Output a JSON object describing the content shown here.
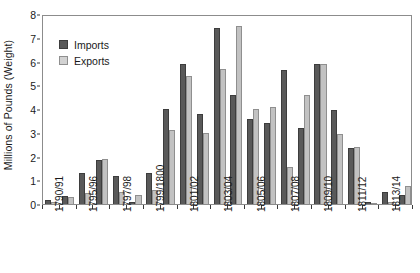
{
  "chart_data": {
    "type": "bar",
    "title": "",
    "subtitle": "",
    "xlabel": "",
    "ylabel": "Millions of Pounds (Weight)",
    "ylim": [
      0,
      8
    ],
    "y_ticks": [
      0,
      1,
      2,
      3,
      4,
      5,
      6,
      7,
      8
    ],
    "y_tick_labels": [
      "0",
      "1",
      "2",
      "3",
      "4",
      "5",
      "6",
      "7",
      "8"
    ],
    "grid": false,
    "legend_position": "upper-left",
    "legend": [
      "Imports",
      "Exports"
    ],
    "colors": {
      "imports": "#595959",
      "exports": "#c2c2c2",
      "imports_edge": "#3d3d3d",
      "exports_edge": "#8f8f8f",
      "frame": "#8c8c8c",
      "text": "#1a1a1a"
    },
    "categories": [
      "1790/91",
      "1791/92",
      "1792/93",
      "1793/94",
      "1794/95",
      "1795/96",
      "1796/97",
      "1797/98",
      "1798/99",
      "1799/1800",
      "1800/01",
      "1801/02",
      "1802/03",
      "1803/04",
      "1804/05",
      "1805/06",
      "1806/07",
      "1807/08",
      "1808/09",
      "1809/10",
      "1810/11",
      "1811/12"
    ],
    "visible_tick_labels": [
      "1790/91",
      "",
      "1795/96",
      "",
      "1797/98",
      "",
      "1799/1800",
      "",
      "1801/02",
      "",
      "1803/04",
      "",
      "1805/06",
      "",
      "1807/08",
      "",
      "1809/10",
      "",
      "1811/12",
      "",
      "1813/14",
      ""
    ],
    "series": [
      {
        "name": "Imports",
        "values": [
          0.15,
          0.35,
          1.3,
          1.85,
          1.2,
          0.1,
          1.3,
          4.0,
          5.9,
          3.8,
          7.4,
          4.6,
          3.6,
          3.4,
          5.65,
          3.2,
          5.9,
          3.95,
          2.35,
          0.1,
          0.5,
          0.4
        ]
      },
      {
        "name": "Exports",
        "values": [
          0.1,
          0.3,
          0.45,
          1.9,
          0.5,
          0.4,
          0.6,
          3.1,
          5.4,
          3.0,
          5.7,
          7.5,
          4.0,
          4.1,
          1.55,
          4.6,
          5.9,
          2.95,
          2.4,
          0.05,
          0.1,
          0.75
        ]
      }
    ]
  }
}
